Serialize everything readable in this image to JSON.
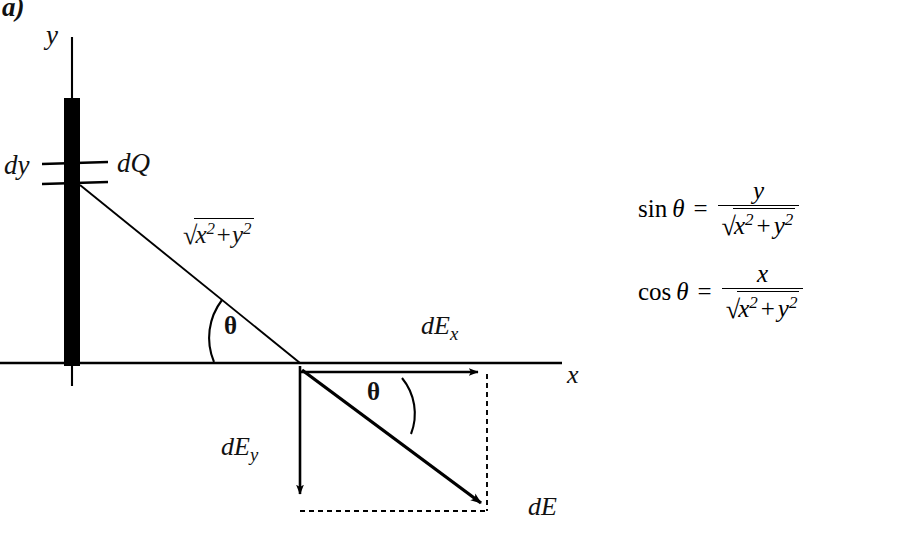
{
  "figure": {
    "part_label": "a)",
    "type": "physics-vector-diagram"
  },
  "axes": {
    "y_label": "y",
    "x_label": "x"
  },
  "rod": {
    "element_thickness_label": "dy",
    "charge_element_label": "dQ"
  },
  "angles": {
    "upper_theta": "θ",
    "lower_theta": "θ"
  },
  "distance": {
    "radical_sign": "√",
    "x_term": "x",
    "x_exp": "2",
    "plus": "+",
    "y_term": "y",
    "y_exp": "2"
  },
  "vectors": {
    "dEx": {
      "base": "dE",
      "subscript": "x"
    },
    "dEy": {
      "base": "dE",
      "subscript": "y"
    },
    "dE": {
      "base": "dE"
    }
  },
  "formulas": [
    {
      "function": "sin",
      "theta": "θ",
      "equals": "=",
      "numerator": "y",
      "denominator": {
        "radical": "√",
        "x": "x",
        "x_exp": "2",
        "plus": "+",
        "y": "y",
        "y_exp": "2"
      }
    },
    {
      "function": "cos",
      "theta": "θ",
      "equals": "=",
      "numerator": "x",
      "denominator": {
        "radical": "√",
        "x": "x",
        "x_exp": "2",
        "plus": "+",
        "y": "y",
        "y_exp": "2"
      }
    }
  ],
  "colors": {
    "ink": "#000000",
    "background": "#ffffff"
  },
  "geometry": {
    "origin_x": 72,
    "x_axis_y": 363,
    "field_point_x": 300,
    "dEx_tip_x": 485,
    "dEy_tip_y": 500,
    "dE_tip_x": 487,
    "dE_tip_y": 508
  }
}
